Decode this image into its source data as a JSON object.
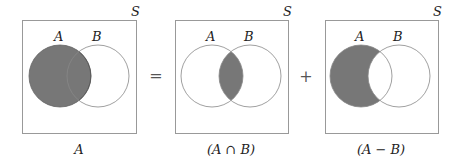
{
  "colors": {
    "fill": "#777777",
    "stroke": "#888888",
    "box_stroke": "#999999",
    "background": "#ffffff"
  },
  "operators": {
    "equals": "=",
    "plus": "+"
  },
  "panels": [
    {
      "universe_label": "S",
      "set_a_label": "A",
      "set_b_label": "B",
      "caption": "A",
      "shaded_region": "A"
    },
    {
      "universe_label": "S",
      "set_a_label": "A",
      "set_b_label": "B",
      "caption": "(A ∩ B)",
      "shaded_region": "A intersect B"
    },
    {
      "universe_label": "S",
      "set_a_label": "A",
      "set_b_label": "B",
      "caption": "(A − B)",
      "shaded_region": "A minus B"
    }
  ]
}
